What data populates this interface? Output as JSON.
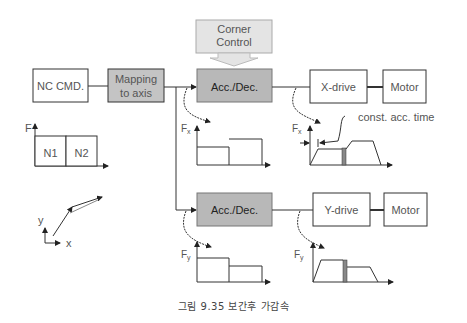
{
  "diagram": {
    "blocks": {
      "nc_cmd": "NC CMD.",
      "mapping_line1": "Mapping",
      "mapping_line2": "to axis",
      "corner_line1": "Corner",
      "corner_line2": "Control",
      "acc_dec_x": "Acc./Dec.",
      "acc_dec_y": "Acc./Dec.",
      "x_drive": "X-drive",
      "y_drive": "Y-drive",
      "motor_x": "Motor",
      "motor_y": "Motor"
    },
    "feed_chart": {
      "axis_label": "F",
      "segments": [
        "N1",
        "N2"
      ]
    },
    "trajectory": {
      "y_label": "y",
      "x_label": "x"
    },
    "plots": {
      "fx_label": "Fx",
      "fx_sub": "x",
      "fy_label": "Fy",
      "fy_sub": "y",
      "annotation": "const. acc. time"
    },
    "colors": {
      "block_gray": "#b8b8b8",
      "corner_gray": "#e4e4e4",
      "line": "#333333"
    }
  },
  "caption": "그림 9.35   보간후 가감속"
}
